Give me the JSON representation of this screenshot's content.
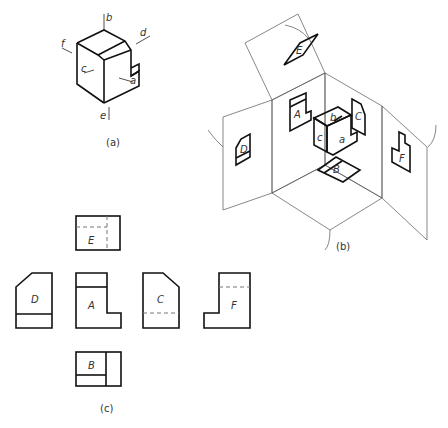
{
  "figure": {
    "type": "orthographic-projection-diagram",
    "caption_visible": "图 ... 六个基本视图的形成及配置 (faint, partially cut off)",
    "caption_text": ""
  },
  "panel_a": {
    "label": "(a)",
    "direction_labels": {
      "a": "a",
      "b": "b",
      "c": "c",
      "d": "d",
      "e": "e",
      "f": "f"
    }
  },
  "panel_b": {
    "label": "(b)",
    "view_labels": {
      "A": "A",
      "B": "B",
      "C": "C",
      "D": "D",
      "E": "E",
      "F": "F"
    },
    "face_labels": {
      "a": "a",
      "b": "b",
      "c": "c"
    }
  },
  "panel_c": {
    "label": "(c)",
    "views": [
      {
        "name": "E",
        "position": "top"
      },
      {
        "name": "D",
        "position": "left"
      },
      {
        "name": "A",
        "position": "center"
      },
      {
        "name": "C",
        "position": "right"
      },
      {
        "name": "F",
        "position": "far-right"
      },
      {
        "name": "B",
        "position": "bottom"
      }
    ]
  }
}
